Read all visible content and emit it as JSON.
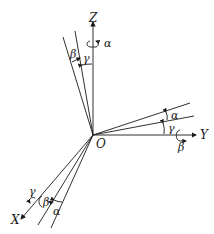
{
  "diagram": {
    "type": "coordinate-axes-rotation",
    "origin_label": "O",
    "axes": [
      {
        "name": "Z",
        "rotation_label": "α"
      },
      {
        "name": "Y",
        "rotation_label": "β"
      },
      {
        "name": "X",
        "rotation_label": "γ"
      }
    ],
    "angle_labels": {
      "z_group": {
        "outer": "β",
        "inner": "γ"
      },
      "y_group": {
        "outer": "α",
        "inner": "γ"
      },
      "x_group": {
        "outer": "β",
        "inner": "α"
      }
    },
    "colors": {
      "line": "#1a1a1a",
      "background": "#ffffff"
    }
  }
}
